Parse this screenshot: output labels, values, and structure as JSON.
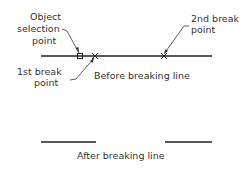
{
  "diagram": {
    "labels": {
      "object_selection_line1": "Object",
      "object_selection_line2": "selection",
      "object_selection_line3": "point",
      "second_break_line1": "2nd break",
      "second_break_line2": "point",
      "first_break_line1": "1st break",
      "first_break_line2": "point",
      "before_caption": "Before breaking line",
      "after_caption": "After breaking line"
    },
    "colors": {
      "line": "#222222",
      "text": "#333333"
    }
  }
}
